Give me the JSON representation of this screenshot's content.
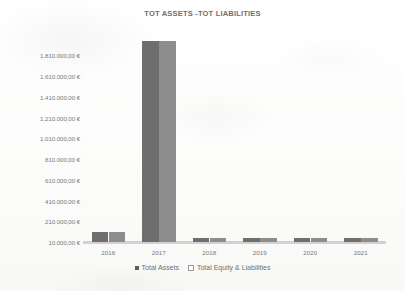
{
  "chart_data": {
    "type": "bar",
    "title": "TOT ASSETS -TOT LIABILITIES",
    "xlabel": "",
    "ylabel": "",
    "categories": [
      "2016",
      "2017",
      "2018",
      "2019",
      "2020",
      "2021"
    ],
    "series": [
      {
        "name": "Total Assets",
        "color": "#6e6e6e",
        "marker": "filled-square",
        "values": [
          110000,
          1945000,
          50000,
          50000,
          50000,
          50000
        ]
      },
      {
        "name": "Total Equity & Liabilities",
        "color": "#8d8d8d",
        "marker": "hollow-square",
        "values": [
          110000,
          1945000,
          50000,
          50000,
          50000,
          50000
        ]
      }
    ],
    "ylim": [
      10000,
      1810000
    ],
    "ytick_values": [
      10000,
      210000,
      410000,
      610000,
      810000,
      1010000,
      1210000,
      1410000,
      1610000,
      1810000
    ],
    "ytick_labels": [
      "10.000,00 €",
      "210.000,00 €",
      "410.000,00 €",
      "610.000,00 €",
      "810.000,00 €",
      "1.010.000,00 €",
      "1.210.000,00 €",
      "1.410.000,00 €",
      "1.610.000,00 €",
      "1.810.000,00 €"
    ],
    "grid": false,
    "legend_position": "bottom",
    "currency": "EUR",
    "number_format": "it-IT"
  },
  "axis": {
    "y_labels": [
      "1.810.000,00 €",
      "1.610.000,00 €",
      "1.410.000,00 €",
      "1.210.000,00 €",
      "1.010.000,00 €",
      "810.000,00 €",
      "610.000,00 €",
      "410.000,00 €",
      "210.000,00 €",
      "10.000,00 €"
    ],
    "x_labels": [
      "2016",
      "2017",
      "2018",
      "2019",
      "2020",
      "2021"
    ]
  },
  "legend": {
    "entries": [
      {
        "label": "Total Assets"
      },
      {
        "label": "Total Equity & Liabilities"
      }
    ]
  },
  "header": {
    "title": "TOT ASSETS -TOT LIABILITIES"
  }
}
